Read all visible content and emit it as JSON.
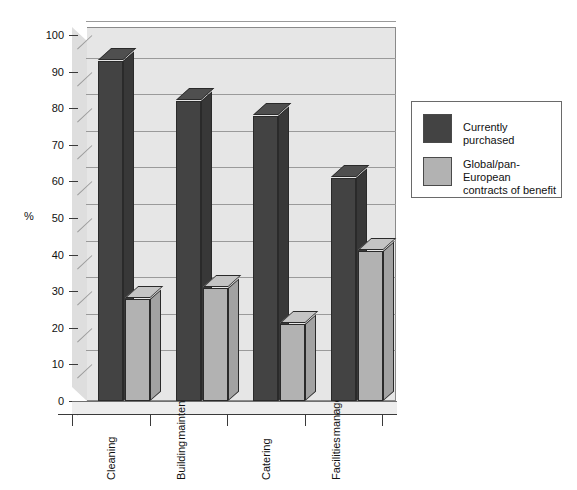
{
  "chart_data": {
    "type": "bar",
    "title": "",
    "subtitle": "",
    "xlabel": "",
    "ylabel": "%",
    "ylim": [
      0,
      100
    ],
    "ytick_step": 10,
    "yticks": [
      "100",
      "90",
      "80",
      "70",
      "60",
      "50",
      "40",
      "30",
      "20",
      "10",
      "0"
    ],
    "grid": true,
    "three_d": true,
    "legend_position": "right",
    "categories": [
      "Cleaning",
      "Building maintenance",
      "Catering",
      "Facilities management"
    ],
    "category_lines": [
      [
        "Cleaning"
      ],
      [
        "Building",
        "maintenance"
      ],
      [
        "Catering"
      ],
      [
        "Facilities",
        "management"
      ]
    ],
    "series": [
      {
        "name": "Currently purchased",
        "color": "#434343",
        "values": [
          93,
          82,
          78,
          61
        ]
      },
      {
        "name": "Global/pan-European contracts of benefit",
        "legend_lines": [
          "Global/pan-European",
          "contracts of benefit"
        ],
        "color": "#b2b2b2",
        "values": [
          28,
          31,
          21,
          41
        ]
      }
    ]
  },
  "legend": {
    "items": [
      {
        "label": "Currently purchased",
        "color": "#434343"
      },
      {
        "label": "Global/pan-European\ncontracts of benefit",
        "color": "#b2b2b2"
      }
    ]
  },
  "axis": {
    "y_label": "%"
  }
}
